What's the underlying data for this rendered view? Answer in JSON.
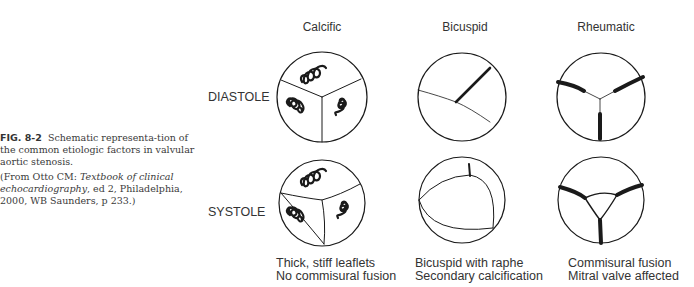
{
  "caption": {
    "figure_label": "FIG. 8-2",
    "title_rest": "Schematic representa-tion of the common etiologic factors in valvular aortic stenosis.",
    "source_prefix": "(From Otto CM: ",
    "source_italic": "Textbook of clinical echocardiography",
    "source_suffix": ", ed 2, Philadelphia, 2000, WB Saunders, p 233.)"
  },
  "columns": [
    {
      "key": "calcific",
      "heading": "Calcific",
      "note_line1": "Thick, stiff leaflets",
      "note_line2": "No commisural fusion"
    },
    {
      "key": "bicuspid",
      "heading": "Bicuspid",
      "note_line1": "Bicuspid with raphe",
      "note_line2": "Secondary calcification"
    },
    {
      "key": "rheumatic",
      "heading": "Rheumatic",
      "note_line1": "Commisural fusion",
      "note_line2": "Mitral valve affected"
    }
  ],
  "rows": [
    {
      "key": "diastole",
      "label": "DIASTOLE"
    },
    {
      "key": "systole",
      "label": "SYSTOLE"
    }
  ],
  "colors": {
    "line": "#1a1a1a",
    "text": "#333333"
  }
}
